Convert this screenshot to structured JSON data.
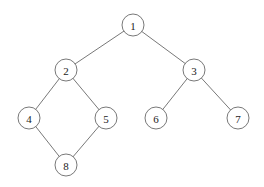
{
  "nodes": [
    {
      "id": "1",
      "label": "1",
      "x": 133,
      "y": 25
    },
    {
      "id": "2",
      "label": "2",
      "x": 66,
      "y": 70
    },
    {
      "id": "3",
      "label": "3",
      "x": 194,
      "y": 70
    },
    {
      "id": "4",
      "label": "4",
      "x": 29,
      "y": 118
    },
    {
      "id": "5",
      "label": "5",
      "x": 106,
      "y": 118
    },
    {
      "id": "6",
      "label": "6",
      "x": 156,
      "y": 118
    },
    {
      "id": "7",
      "label": "7",
      "x": 238,
      "y": 118
    },
    {
      "id": "8",
      "label": "8",
      "x": 66,
      "y": 165
    }
  ],
  "edges": [
    [
      "1",
      "2"
    ],
    [
      "1",
      "3"
    ],
    [
      "2",
      "4"
    ],
    [
      "2",
      "5"
    ],
    [
      "3",
      "6"
    ],
    [
      "3",
      "7"
    ],
    [
      "4",
      "8"
    ],
    [
      "5",
      "8"
    ]
  ],
  "radius": 11
}
